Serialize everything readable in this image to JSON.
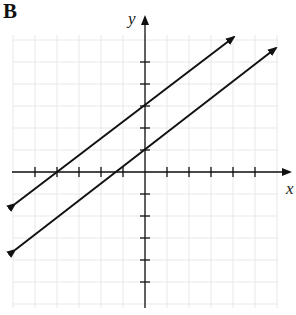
{
  "panel": {
    "label": "B"
  },
  "chart_data": {
    "type": "line",
    "title": "",
    "xlabel": "x",
    "ylabel": "y",
    "xlim": [
      -6,
      6
    ],
    "ylim": [
      -6,
      6
    ],
    "grid": true,
    "x_ticks": [
      -5,
      -4,
      -3,
      -2,
      -1,
      1,
      2,
      3,
      4,
      5
    ],
    "y_ticks": [
      -5,
      -4,
      -3,
      -2,
      -1,
      1,
      2,
      3,
      4,
      5
    ],
    "tick_labels_shown": false,
    "series": [
      {
        "name": "upper line",
        "slope": 0.75,
        "y_intercept": 3,
        "x_intercept": -4,
        "points": [
          [
            -6,
            -1.5
          ],
          [
            4,
            6
          ]
        ],
        "arrows": "both"
      },
      {
        "name": "lower line",
        "slope": 0.75,
        "y_intercept": 1,
        "x_intercept": -1.33,
        "points": [
          [
            -6,
            -3.5
          ],
          [
            6,
            5.5
          ]
        ],
        "arrows": "both"
      }
    ],
    "annotations": [
      "Parallel lines with equal slope"
    ]
  },
  "colors": {
    "line": "#111111",
    "axis": "#111111",
    "grid": "#e6e6e6",
    "background": "#ffffff"
  }
}
